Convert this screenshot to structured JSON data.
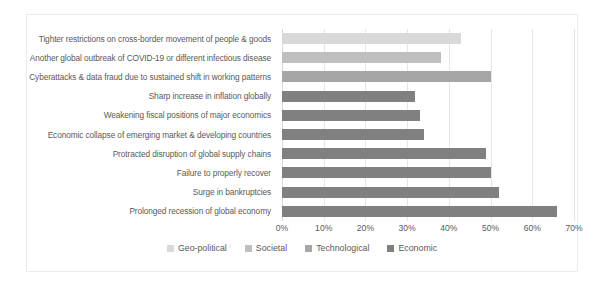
{
  "caption": {
    "clipped_text": ""
  },
  "chart_data": {
    "type": "bar",
    "orientation": "horizontal",
    "title": "",
    "xlabel": "",
    "ylabel": "",
    "xlim": [
      0,
      70
    ],
    "xticks": [
      "0%",
      "10%",
      "20%",
      "30%",
      "40%",
      "50%",
      "60%",
      "70%"
    ],
    "xtick_values": [
      0,
      10,
      20,
      30,
      40,
      50,
      60,
      70
    ],
    "grid": true,
    "legend_position": "bottom",
    "categories": [
      "Tighter restrictions on cross-border movement of people & goods",
      "Another global outbreak of COVID-19 or different infectious disease",
      "Cyberattacks & data fraud due to sustained shift in working patterns",
      "Sharp increase in inflation globally",
      "Weakening fiscal positions of major economics",
      "Economic collapse of emerging market & developing countries",
      "Protracted disruption of global supply chains",
      "Failure to properly recover",
      "Surge in bankruptcies",
      "Prolonged recession of global economy"
    ],
    "values": [
      43,
      38,
      50,
      32,
      33,
      34,
      49,
      50,
      52,
      66
    ],
    "point_groups": [
      "Geo-political",
      "Societal",
      "Technological",
      "Economic",
      "Economic",
      "Economic",
      "Economic",
      "Economic",
      "Economic",
      "Economic"
    ],
    "series": [
      {
        "name": "Geo-political",
        "color": "#d9d9d9",
        "points": [
          {
            "category": "Tighter restrictions on cross-border movement of people & goods",
            "value": 43
          }
        ]
      },
      {
        "name": "Societal",
        "color": "#bfbfbf",
        "points": [
          {
            "category": "Another global outbreak of COVID-19 or different infectious disease",
            "value": 38
          }
        ]
      },
      {
        "name": "Technological",
        "color": "#a6a6a6",
        "points": [
          {
            "category": "Cyberattacks & data fraud due to sustained shift in working patterns",
            "value": 50
          }
        ]
      },
      {
        "name": "Economic",
        "color": "#808080",
        "points": [
          {
            "category": "Sharp increase in inflation globally",
            "value": 32
          },
          {
            "category": "Weakening fiscal positions of major economics",
            "value": 33
          },
          {
            "category": "Economic collapse of emerging market & developing countries",
            "value": 34
          },
          {
            "category": "Protracted disruption of global supply chains",
            "value": 49
          },
          {
            "category": "Failure to properly recover",
            "value": 50
          },
          {
            "category": "Surge in bankruptcies",
            "value": 52
          },
          {
            "category": "Prolonged recession of global economy",
            "value": 66
          }
        ]
      }
    ],
    "legend": [
      {
        "label": "Geo-political",
        "color": "#d9d9d9"
      },
      {
        "label": "Societal",
        "color": "#bfbfbf"
      },
      {
        "label": "Technological",
        "color": "#a6a6a6"
      },
      {
        "label": "Economic",
        "color": "#808080"
      }
    ]
  }
}
